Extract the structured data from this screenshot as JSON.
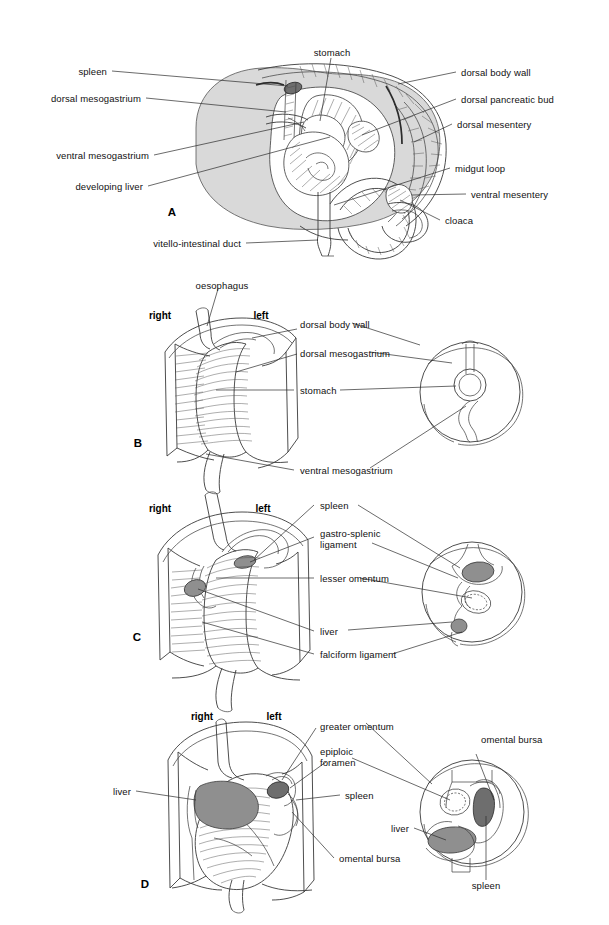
{
  "figure": {
    "background": "#ffffff",
    "ink": "#1a1a1a",
    "panel_count": 4
  },
  "panels": [
    {
      "id": "A",
      "panel_label": "A",
      "caption": "Sagittal view of embryo gut and mesenteries",
      "labels_left": [
        {
          "text": "spleen"
        },
        {
          "text": "dorsal mesogastrium"
        },
        {
          "text": "ventral mesogastrium"
        },
        {
          "text": "developing liver"
        },
        {
          "text": "vitello-intestinal duct"
        }
      ],
      "labels_top": [
        {
          "text": "stomach"
        }
      ],
      "labels_right": [
        {
          "text": "dorsal body wall"
        },
        {
          "text": "dorsal pancreatic bud"
        },
        {
          "text": "dorsal mesentery"
        },
        {
          "text": "midgut loop"
        },
        {
          "text": "ventral mesentery"
        },
        {
          "text": "cloaca"
        }
      ]
    },
    {
      "id": "B",
      "panel_label": "B",
      "caption": "Stomach suspended in dorsal and ventral mesogastrium",
      "orientation": {
        "left": "left",
        "right": "right"
      },
      "labels_top": [
        {
          "text": "oesophagus"
        }
      ],
      "labels_right": [
        {
          "text": "dorsal body wall"
        },
        {
          "text": "dorsal mesogastrium"
        },
        {
          "text": "stomach"
        },
        {
          "text": "ventral mesogastrium"
        }
      ]
    },
    {
      "id": "C",
      "panel_label": "C",
      "caption": "Spleen and liver develop within the mesogastria",
      "orientation": {
        "left": "left",
        "right": "right"
      },
      "labels_right": [
        {
          "text": "spleen"
        },
        {
          "text": "gastro-splenic\nligament"
        },
        {
          "text": "lesser omentum"
        },
        {
          "text": "liver"
        },
        {
          "text": "falciform ligament"
        }
      ]
    },
    {
      "id": "D",
      "panel_label": "D",
      "caption": "Rotation forms greater omentum and omental bursa",
      "orientation": {
        "left": "left",
        "right": "right"
      },
      "labels_left": [
        {
          "text": "liver"
        }
      ],
      "labels_right": [
        {
          "text": "greater omentum"
        },
        {
          "text": "epiploic\nforamen"
        },
        {
          "text": "spleen"
        },
        {
          "text": "omental bursa"
        }
      ],
      "labels_section": [
        {
          "text": "omental bursa"
        },
        {
          "text": "liver"
        },
        {
          "text": "spleen"
        }
      ]
    }
  ],
  "colors": {
    "body_fill": "#d9d9d9",
    "organ_mid": "#8f8f8f",
    "organ_dark": "#6e6e6e",
    "line": "#2b2b2b",
    "paper": "#ffffff"
  }
}
